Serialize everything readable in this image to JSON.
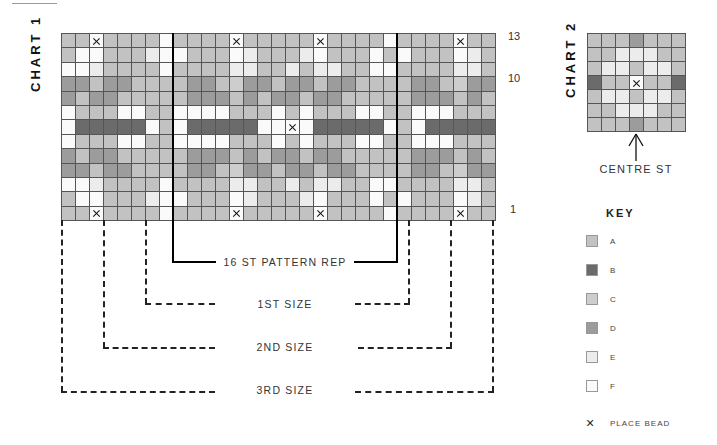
{
  "chart1": {
    "title": "CHART 1",
    "row_numbers": [
      {
        "label": "13",
        "row": 13
      },
      {
        "label": "10",
        "row": 10
      },
      {
        "label": "1",
        "row": 1
      }
    ],
    "pattern_repeat_label": "16 ST PATTERN REP",
    "sizes": [
      "1ST SIZE",
      "2ND SIZE",
      "3RD SIZE"
    ],
    "columns": 31,
    "rows_top_to_bottom": [
      "AAXAAAAFAAAAXAAAAAXAAAAFAAAAXAA",
      "AFFAAAEFFAAAFEAAAEFAAAFAFAAAFEA",
      "FFEAAAAFAAAAEEAAEAEEAAFFAAAAEEA",
      "DDADDAAAADDACDDADDADDAAAADDACDD",
      "DADDAAAAADDDADADDADDAAAAADDDADA",
      "FAAAFFAAFFFFAAAFAFAAAFFAAFFFAAA",
      "FBBBBBFAFBBBBBFFXFBBBBBFAFBBBBB",
      "FAAAFFAAFFFFAAAFAFAAAFFAAFFFAAA",
      "DADDAAAAADDDADADDADDAAAAADDDADA",
      "DDADDAAAADDACDDADDADDAAAADDACDD",
      "FFEAAAAFAAAAEEAAEAEEAAFFAAAAEEA",
      "AFFAAAEFFAAAFEAAAEFAAAFAFAAAFEA",
      "AAXAAAAFAAAAXAAAAAXAAAAFAAAAXAA"
    ]
  },
  "chart2": {
    "title": "CHART 2",
    "centre_label": "CENTRE ST",
    "columns": 7,
    "rows_top_to_bottom": [
      "AAADAAA",
      "AAEEEAA",
      "AEEAEEA",
      "BAAXAAB",
      "AEEAEEA",
      "AAEEEAA",
      "AAADAAA"
    ]
  },
  "key": {
    "title": "KEY",
    "items": [
      {
        "code": "A",
        "label": "A",
        "color": "#c2c2c2"
      },
      {
        "code": "B",
        "label": "B",
        "color": "#6b6b6b"
      },
      {
        "code": "C",
        "label": "C",
        "color": "#cdcdcd"
      },
      {
        "code": "D",
        "label": "D",
        "color": "#9c9c9c"
      },
      {
        "code": "E",
        "label": "E",
        "color": "#ececec"
      },
      {
        "code": "F",
        "label": "F",
        "color": "#fafafa"
      }
    ],
    "bead_label": "PLACE BEAD",
    "bead_symbol": "×"
  }
}
